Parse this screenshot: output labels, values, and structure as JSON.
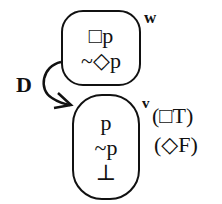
{
  "diagram": {
    "type": "modal-logic-tree",
    "worlds": [
      {
        "id": "w",
        "label": "w",
        "formulas": [
          "□p",
          "~◇p"
        ]
      },
      {
        "id": "v",
        "label": "v",
        "formulas": [
          "p",
          "~p",
          "⊥"
        ],
        "annotations": [
          "(□T)",
          "(◇F)"
        ]
      }
    ],
    "edges": [
      {
        "from": "w",
        "to": "v",
        "label": "D"
      }
    ],
    "colors": {
      "stroke": "#111111",
      "background": "#ffffff"
    }
  }
}
